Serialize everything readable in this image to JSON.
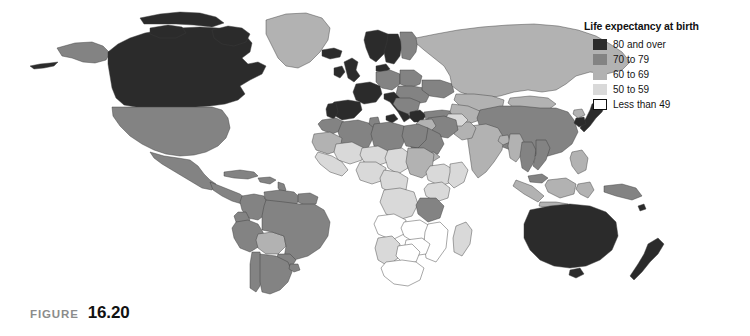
{
  "figure": {
    "word": "FIGURE",
    "number": "16.20"
  },
  "legend": {
    "title": "Life expectancy at birth",
    "items": [
      {
        "label": "80 and over",
        "color": "#2b2b2b",
        "outlined": false
      },
      {
        "label": "70 to 79",
        "color": "#838383",
        "outlined": false
      },
      {
        "label": "60 to 69",
        "color": "#b2b2b2",
        "outlined": false
      },
      {
        "label": "50 to 59",
        "color": "#d9d9d9",
        "outlined": false
      },
      {
        "label": "Less than 49",
        "color": "#ffffff",
        "outlined": true
      }
    ]
  },
  "map": {
    "type": "choropleth",
    "projection": "world",
    "ocean_color": "#ffffff",
    "border_color": "#3d3d3d",
    "class_colors": {
      "c80": "#2b2b2b",
      "c70": "#838383",
      "c60": "#b2b2b2",
      "c50": "#d9d9d9",
      "c49": "#ffffff"
    },
    "regions": [
      {
        "name": "Canada",
        "class": "c80"
      },
      {
        "name": "Greenland",
        "class": "c60"
      },
      {
        "name": "Alaska",
        "class": "c70"
      },
      {
        "name": "United States",
        "class": "c70"
      },
      {
        "name": "Mexico",
        "class": "c70"
      },
      {
        "name": "Central America",
        "class": "c70"
      },
      {
        "name": "Caribbean",
        "class": "c70"
      },
      {
        "name": "Colombia",
        "class": "c70"
      },
      {
        "name": "Venezuela",
        "class": "c70"
      },
      {
        "name": "Guianas",
        "class": "c70"
      },
      {
        "name": "Ecuador",
        "class": "c70"
      },
      {
        "name": "Peru",
        "class": "c70"
      },
      {
        "name": "Bolivia",
        "class": "c60"
      },
      {
        "name": "Brazil",
        "class": "c70"
      },
      {
        "name": "Paraguay",
        "class": "c70"
      },
      {
        "name": "Chile",
        "class": "c70"
      },
      {
        "name": "Argentina",
        "class": "c70"
      },
      {
        "name": "Uruguay",
        "class": "c70"
      },
      {
        "name": "Iceland",
        "class": "c80"
      },
      {
        "name": "United Kingdom",
        "class": "c80"
      },
      {
        "name": "Ireland",
        "class": "c80"
      },
      {
        "name": "Norway",
        "class": "c80"
      },
      {
        "name": "Sweden",
        "class": "c80"
      },
      {
        "name": "Finland",
        "class": "c70"
      },
      {
        "name": "Denmark",
        "class": "c80"
      },
      {
        "name": "France",
        "class": "c80"
      },
      {
        "name": "Spain",
        "class": "c80"
      },
      {
        "name": "Portugal",
        "class": "c80"
      },
      {
        "name": "Italy",
        "class": "c80"
      },
      {
        "name": "Germany",
        "class": "c70"
      },
      {
        "name": "Poland",
        "class": "c70"
      },
      {
        "name": "Eastern Europe",
        "class": "c70"
      },
      {
        "name": "Balkans",
        "class": "c70"
      },
      {
        "name": "Greece",
        "class": "c80"
      },
      {
        "name": "Turkey",
        "class": "c70"
      },
      {
        "name": "Ukraine",
        "class": "c70"
      },
      {
        "name": "Russia",
        "class": "c60"
      },
      {
        "name": "Kazakhstan",
        "class": "c60"
      },
      {
        "name": "Central Asia",
        "class": "c60"
      },
      {
        "name": "Mongolia",
        "class": "c60"
      },
      {
        "name": "China",
        "class": "c70"
      },
      {
        "name": "Japan",
        "class": "c80"
      },
      {
        "name": "South Korea",
        "class": "c80"
      },
      {
        "name": "North Korea",
        "class": "c60"
      },
      {
        "name": "India",
        "class": "c60"
      },
      {
        "name": "Pakistan",
        "class": "c60"
      },
      {
        "name": "Afghanistan",
        "class": "c50"
      },
      {
        "name": "Iran",
        "class": "c70"
      },
      {
        "name": "Iraq",
        "class": "c60"
      },
      {
        "name": "Saudi Arabia",
        "class": "c70"
      },
      {
        "name": "Yemen",
        "class": "c60"
      },
      {
        "name": "Bangladesh",
        "class": "c60"
      },
      {
        "name": "Myanmar",
        "class": "c60"
      },
      {
        "name": "Thailand",
        "class": "c70"
      },
      {
        "name": "Vietnam",
        "class": "c70"
      },
      {
        "name": "Indonesia",
        "class": "c60"
      },
      {
        "name": "Philippines",
        "class": "c60"
      },
      {
        "name": "Malaysia",
        "class": "c70"
      },
      {
        "name": "Papua New Guinea",
        "class": "c60"
      },
      {
        "name": "Australia",
        "class": "c80"
      },
      {
        "name": "New Zealand",
        "class": "c80"
      },
      {
        "name": "Morocco",
        "class": "c70"
      },
      {
        "name": "Algeria",
        "class": "c70"
      },
      {
        "name": "Libya",
        "class": "c70"
      },
      {
        "name": "Egypt",
        "class": "c70"
      },
      {
        "name": "Tunisia",
        "class": "c70"
      },
      {
        "name": "Mauritania",
        "class": "c60"
      },
      {
        "name": "Mali",
        "class": "c50"
      },
      {
        "name": "Niger",
        "class": "c50"
      },
      {
        "name": "Chad",
        "class": "c50"
      },
      {
        "name": "Sudan",
        "class": "c60"
      },
      {
        "name": "Ethiopia",
        "class": "c50"
      },
      {
        "name": "Somalia",
        "class": "c50"
      },
      {
        "name": "Kenya",
        "class": "c50"
      },
      {
        "name": "Nigeria",
        "class": "c50"
      },
      {
        "name": "West Africa",
        "class": "c50"
      },
      {
        "name": "Central Africa",
        "class": "c50"
      },
      {
        "name": "DR Congo",
        "class": "c50"
      },
      {
        "name": "Tanzania",
        "class": "c50"
      },
      {
        "name": "Angola",
        "class": "c49"
      },
      {
        "name": "Zambia",
        "class": "c49"
      },
      {
        "name": "Zimbabwe",
        "class": "c49"
      },
      {
        "name": "Mozambique",
        "class": "c49"
      },
      {
        "name": "Botswana",
        "class": "c49"
      },
      {
        "name": "Namibia",
        "class": "c50"
      },
      {
        "name": "South Africa",
        "class": "c49"
      },
      {
        "name": "Madagascar",
        "class": "c50"
      }
    ]
  }
}
